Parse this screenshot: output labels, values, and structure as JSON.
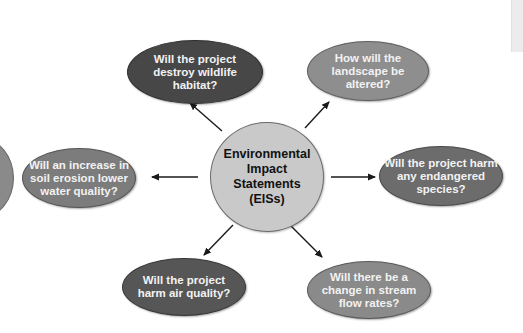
{
  "diagram": {
    "type": "hub-and-spoke",
    "center": {
      "label": "Environmental Impact Statements (EISs)",
      "color": "#c9c9c9",
      "text_color": "#111111"
    },
    "nodes": [
      {
        "id": "wildlife",
        "label": "Will the project destroy wildlife habitat?",
        "color": "#474747",
        "position": "top-left"
      },
      {
        "id": "landscape",
        "label": "How will the landscape be altered?",
        "color": "#8e8e8e",
        "position": "top-right"
      },
      {
        "id": "erosion",
        "label": "Will an increase in soil erosion lower water quality?",
        "color": "#7c7c7c",
        "position": "left"
      },
      {
        "id": "species",
        "label": "Will the project harm any endangered species?",
        "color": "#6c6c6c",
        "position": "right"
      },
      {
        "id": "air",
        "label": "Will the project harm air quality?",
        "color": "#565656",
        "position": "bottom-left"
      },
      {
        "id": "stream",
        "label": "Will there be a change in stream flow rates?",
        "color": "#8a8a8a",
        "position": "bottom-right"
      }
    ],
    "edges": [
      {
        "from": "center",
        "to": "wildlife"
      },
      {
        "from": "center",
        "to": "landscape"
      },
      {
        "from": "center",
        "to": "erosion"
      },
      {
        "from": "center",
        "to": "species"
      },
      {
        "from": "center",
        "to": "air"
      },
      {
        "from": "center",
        "to": "stream"
      }
    ],
    "arrow_color": "#1a1a1a"
  }
}
